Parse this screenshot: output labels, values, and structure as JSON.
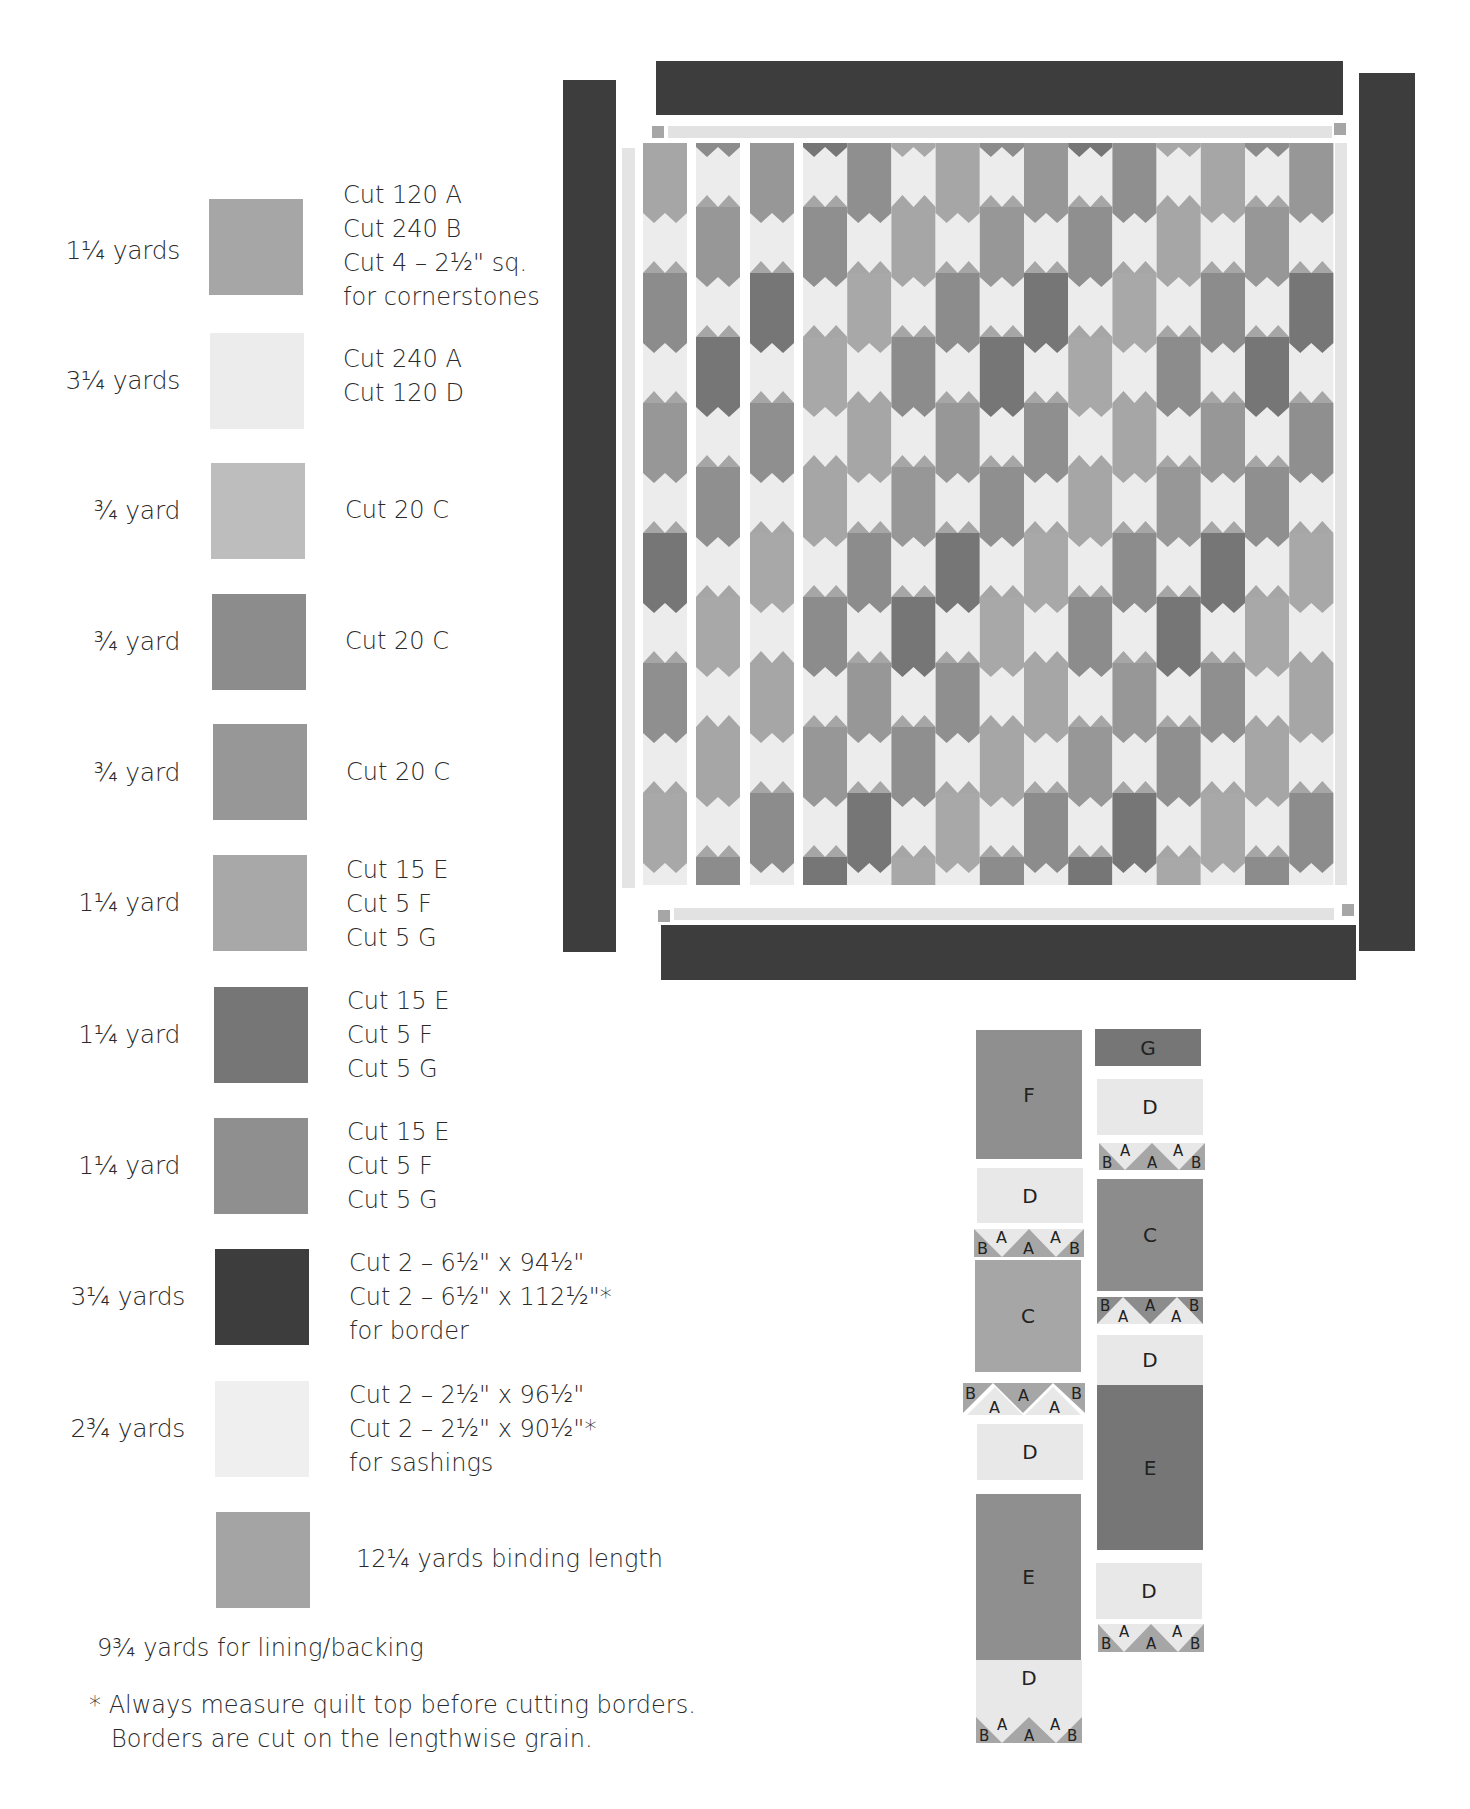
{
  "colors": {
    "fabric_medium": "#a6a6a6",
    "fabric_background": "#ececec",
    "fabric_light": "#bdbdbd",
    "fabric_c2": "#8c8c8c",
    "fabric_c3": "#979797",
    "fabric_efg1": "#a8a8a8",
    "fabric_efg2": "#767676",
    "fabric_efg3": "#8f8f8f",
    "border": "#3d3d3d",
    "sashing": "#e2e2e2",
    "binding": "#a4a4a4"
  },
  "legend": [
    {
      "qty": "1¼ yards",
      "cuts": [
        "Cut 120 A",
        "Cut 240 B",
        "Cut 4 – 2½\" sq.",
        "for cornerstones"
      ],
      "swatch": "fabric_medium"
    },
    {
      "qty": "3¼ yards",
      "cuts": [
        "Cut 240 A",
        "Cut 120 D"
      ],
      "swatch": "fabric_background"
    },
    {
      "qty": "¾ yard",
      "cuts": [
        "Cut 20 C"
      ],
      "swatch": "fabric_light"
    },
    {
      "qty": "¾ yard",
      "cuts": [
        "Cut 20 C"
      ],
      "swatch": "fabric_c2"
    },
    {
      "qty": "¾ yard",
      "cuts": [
        "Cut 20 C"
      ],
      "swatch": "fabric_c3"
    },
    {
      "qty": "1¼ yard",
      "cuts": [
        "Cut 15 E",
        "Cut 5 F",
        "Cut 5 G"
      ],
      "swatch": "fabric_efg1"
    },
    {
      "qty": "1¼ yard",
      "cuts": [
        "Cut 15 E",
        "Cut 5 F",
        "Cut 5 G"
      ],
      "swatch": "fabric_efg2"
    },
    {
      "qty": "1¼ yard",
      "cuts": [
        "Cut 15 E",
        "Cut 5 F",
        "Cut 5 G"
      ],
      "swatch": "fabric_efg3"
    },
    {
      "qty": "3¼ yards",
      "cuts": [
        "Cut 2 – 6½\" x 94½\"",
        "Cut 2 – 6½\" x 112½\"*",
        "for border"
      ],
      "swatch": "border"
    },
    {
      "qty": "2¾ yards",
      "cuts": [
        "Cut 2 – 2½\" x 96½\"",
        "Cut 2 – 2½\" x 90½\"*",
        "for sashings"
      ],
      "swatch": "sashing"
    },
    {
      "qty": "",
      "cuts": [
        "12¼ yards binding length"
      ],
      "swatch": "binding"
    }
  ],
  "notes": {
    "lining": "9¾ yards for lining/backing",
    "footnote_line1": "* Always measure quilt top before cutting borders.",
    "footnote_line2": "Borders are cut on the lengthwise grain."
  },
  "block_diagram": {
    "left_column": [
      {
        "label": "F",
        "type": "rect"
      },
      {
        "label": "D",
        "type": "rect"
      },
      {
        "labels": [
          "B",
          "A",
          "A",
          "A",
          "B"
        ],
        "type": "triangles"
      },
      {
        "label": "C",
        "type": "rect"
      },
      {
        "labels": [
          "B",
          "A",
          "A",
          "A",
          "B"
        ],
        "type": "triangles"
      },
      {
        "label": "D",
        "type": "rect"
      },
      {
        "label": "E",
        "type": "rect"
      },
      {
        "label": "D",
        "type": "rect"
      },
      {
        "labels": [
          "B",
          "A",
          "A",
          "A",
          "B"
        ],
        "type": "triangles"
      }
    ],
    "right_column": [
      {
        "label": "G",
        "type": "rect"
      },
      {
        "label": "D",
        "type": "rect"
      },
      {
        "labels": [
          "B",
          "A",
          "A",
          "A",
          "B"
        ],
        "type": "triangles"
      },
      {
        "label": "C",
        "type": "rect"
      },
      {
        "labels": [
          "B",
          "A",
          "A",
          "A",
          "B"
        ],
        "type": "triangles"
      },
      {
        "label": "D",
        "type": "rect"
      },
      {
        "label": "E",
        "type": "rect"
      },
      {
        "label": "D",
        "type": "rect"
      },
      {
        "labels": [
          "B",
          "A",
          "A",
          "A",
          "B"
        ],
        "type": "triangles"
      }
    ]
  }
}
